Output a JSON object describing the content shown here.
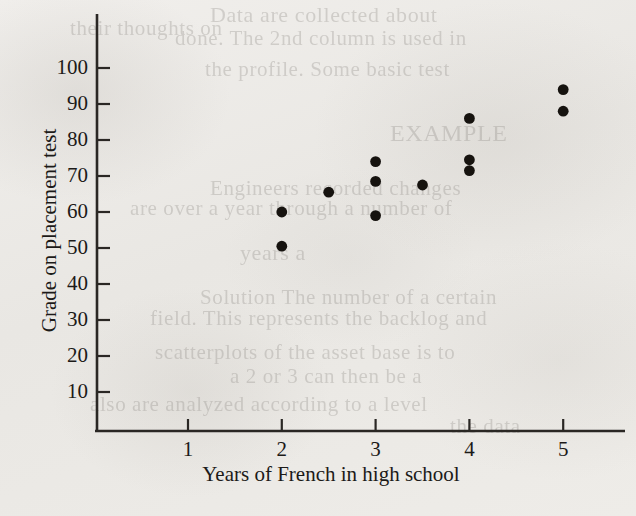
{
  "chart_data": {
    "type": "scatter",
    "title": "",
    "xlabel": "Years of French in high school",
    "ylabel": "Grade on placement test",
    "xlim": [
      0.5,
      5.6
    ],
    "ylim": [
      0,
      108
    ],
    "grid": false,
    "legend": null,
    "xticks": [
      1,
      2,
      3,
      4,
      5
    ],
    "xtick_labels": [
      "1",
      "2",
      "3",
      "4",
      "5"
    ],
    "yticks": [
      10,
      20,
      30,
      40,
      50,
      60,
      70,
      80,
      90,
      100
    ],
    "ytick_labels": [
      "10",
      "20",
      "30",
      "40",
      "50",
      "60",
      "70",
      "80",
      "90",
      "100"
    ],
    "marker": "filled-circle",
    "marker_color": "#16130f",
    "points": [
      {
        "x": 2,
        "y": 60
      },
      {
        "x": 2,
        "y": 50.5
      },
      {
        "x": 2.5,
        "y": 65.5
      },
      {
        "x": 3,
        "y": 74
      },
      {
        "x": 3,
        "y": 68.5
      },
      {
        "x": 3,
        "y": 59
      },
      {
        "x": 3.5,
        "y": 67.5
      },
      {
        "x": 4,
        "y": 86
      },
      {
        "x": 4,
        "y": 74.5
      },
      {
        "x": 4,
        "y": 71.5
      },
      {
        "x": 5,
        "y": 94
      },
      {
        "x": 5,
        "y": 88
      }
    ]
  },
  "axes": {
    "y_axis_name": "y-axis",
    "x_axis_name": "x-axis"
  },
  "page": {
    "background_color": "#eceae6",
    "ink_color": "#1c1a18",
    "bleed_through_lines": [
      {
        "text": "Data are collected about",
        "x": 210,
        "y": 2,
        "size": 22
      },
      {
        "text": "their thoughts on",
        "x": 70,
        "y": 16,
        "size": 21
      },
      {
        "text": "done. The 2nd column is used in",
        "x": 175,
        "y": 26,
        "size": 21
      },
      {
        "text": "the profile. Some basic test",
        "x": 205,
        "y": 57,
        "size": 21
      },
      {
        "text": "EXAMPLE",
        "x": 390,
        "y": 120,
        "size": 24
      },
      {
        "text": "Engineers recorded changes",
        "x": 210,
        "y": 176,
        "size": 21
      },
      {
        "text": "are over a year through a number of",
        "x": 130,
        "y": 196,
        "size": 21
      },
      {
        "text": "years  a",
        "x": 240,
        "y": 240,
        "size": 22
      },
      {
        "text": "Solution  The number of a certain",
        "x": 200,
        "y": 285,
        "size": 21
      },
      {
        "text": "field. This represents the backlog and",
        "x": 150,
        "y": 306,
        "size": 21
      },
      {
        "text": "scatterplots  of the asset base is to",
        "x": 155,
        "y": 340,
        "size": 21
      },
      {
        "text": "a 2 or 3 can then be a",
        "x": 230,
        "y": 364,
        "size": 21
      },
      {
        "text": "also are analyzed according to a level",
        "x": 90,
        "y": 392,
        "size": 21
      },
      {
        "text": "the data",
        "x": 450,
        "y": 414,
        "size": 21
      }
    ]
  }
}
